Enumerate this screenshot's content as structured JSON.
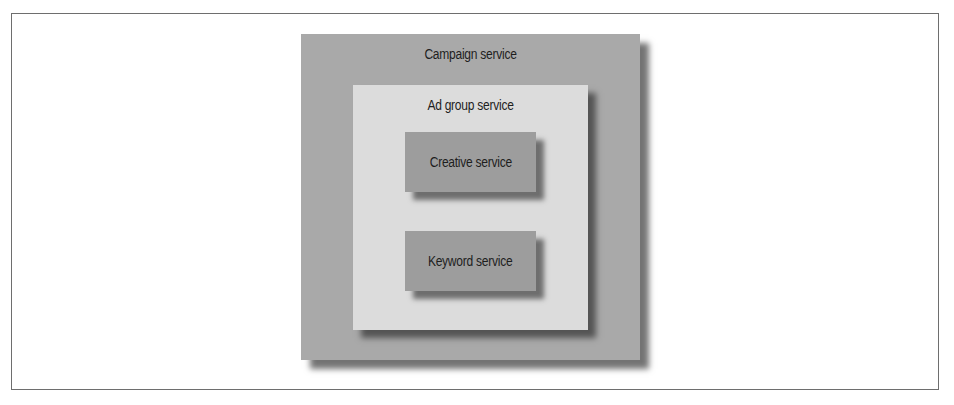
{
  "diagram": {
    "type": "nested-boxes",
    "colors": {
      "outer_fill": "#a9a9a9",
      "inner_fill": "#dcdcdc",
      "leaf_fill": "#9d9d9d",
      "text": "#1e1e1e",
      "frame_border": "#6e6e6e"
    },
    "outer": {
      "label": "Campaign service",
      "inner": {
        "label": "Ad group service",
        "children": [
          {
            "label": "Creative service"
          },
          {
            "label": "Keyword service"
          }
        ]
      }
    }
  }
}
